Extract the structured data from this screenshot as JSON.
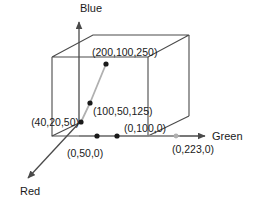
{
  "figure": {
    "background_color": "#ffffff",
    "stroke_color": "#4a4a4a",
    "point_color": "#1a1a1a",
    "guide_color": "#a8a8a8",
    "text_color": "#1a1a1a"
  },
  "axes": [
    {
      "name": "blue-axis",
      "label": "Blue",
      "label_x": 91,
      "label_y": 12
    },
    {
      "name": "green-axis",
      "label": "Green",
      "label_x": 212,
      "label_y": 140
    },
    {
      "name": "red-axis",
      "label": "Red",
      "label_x": 20,
      "label_y": 195
    }
  ],
  "points": [
    {
      "name": "point-200-100-250",
      "label": "(200,100,250)",
      "coords": [
        200,
        100,
        250
      ],
      "dot_x": 106,
      "dot_y": 64,
      "label_x": 92,
      "label_y": 56,
      "anchor": "start"
    },
    {
      "name": "point-100-50-125",
      "label": "(100,50,125)",
      "coords": [
        100,
        50,
        125
      ],
      "dot_x": 90,
      "dot_y": 103,
      "label_x": 93,
      "label_y": 115,
      "anchor": "start"
    },
    {
      "name": "point-40-20-50",
      "label": "(40,20,50)",
      "coords": [
        40,
        20,
        50
      ],
      "dot_x": 81,
      "dot_y": 122,
      "label_x": 77,
      "label_y": 126,
      "anchor": "end"
    },
    {
      "name": "point-0-50-0",
      "label": "(0,50,0)",
      "coords": [
        0,
        50,
        0
      ],
      "dot_x": 97,
      "dot_y": 136,
      "label_x": 67,
      "label_y": 157,
      "anchor": "start"
    },
    {
      "name": "point-0-100-0",
      "label": "(0,100,0)",
      "coords": [
        0,
        100,
        0
      ],
      "dot_x": 117,
      "dot_y": 136,
      "label_x": 124,
      "label_y": 132,
      "anchor": "start"
    },
    {
      "name": "point-0-223-0",
      "label": "(0,223,0)",
      "coords": [
        0,
        223,
        0
      ],
      "dot_x": 176,
      "dot_y": 136,
      "label_x": 172,
      "label_y": 153,
      "anchor": "start"
    }
  ]
}
